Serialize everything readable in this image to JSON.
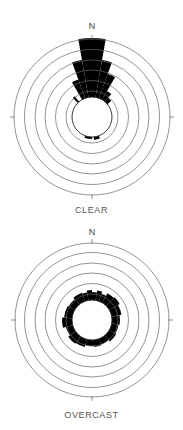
{
  "chart_data": [
    {
      "type": "rose",
      "title": "CLEAR",
      "north_label": "N",
      "center": [
        92,
        117
      ],
      "inner_radius": 20,
      "ring_radii": [
        26,
        36.5,
        47,
        57,
        67.5,
        78
      ],
      "sectors_deg": [
        {
          "from": -30,
          "to": -20,
          "r": 40
        },
        {
          "from": -20,
          "to": -10,
          "r": 58
        },
        {
          "from": -10,
          "to": 0,
          "r": 79
        },
        {
          "from": 0,
          "to": 10,
          "r": 79
        },
        {
          "from": 10,
          "to": 20,
          "r": 58
        },
        {
          "from": 20,
          "to": 30,
          "r": 46
        },
        {
          "from": 30,
          "to": 40,
          "r": 30
        },
        {
          "from": 40,
          "to": 50,
          "r": 25
        },
        {
          "from": -45,
          "to": -40,
          "r": 27
        },
        {
          "from": 160,
          "to": 175,
          "r": 23
        },
        {
          "from": 180,
          "to": 200,
          "r": 22
        }
      ]
    },
    {
      "type": "rose",
      "title": "OVERCAST",
      "north_label": "N",
      "center": [
        92,
        320
      ],
      "inner_radius": 20,
      "ring_radii": [
        26,
        36.5,
        47,
        57,
        67.5,
        77
      ],
      "sectors_deg": [
        {
          "from": -40,
          "to": -20,
          "r": 29
        },
        {
          "from": -20,
          "to": -10,
          "r": 28
        },
        {
          "from": -10,
          "to": 0,
          "r": 30
        },
        {
          "from": 0,
          "to": 10,
          "r": 28
        },
        {
          "from": 10,
          "to": 20,
          "r": 30
        },
        {
          "from": 20,
          "to": 30,
          "r": 28
        },
        {
          "from": 30,
          "to": 45,
          "r": 31
        },
        {
          "from": 45,
          "to": 60,
          "r": 32
        },
        {
          "from": 60,
          "to": 80,
          "r": 30
        },
        {
          "from": 80,
          "to": 100,
          "r": 28
        },
        {
          "from": 100,
          "to": 120,
          "r": 27
        },
        {
          "from": 120,
          "to": 140,
          "r": 28
        },
        {
          "from": 140,
          "to": 160,
          "r": 26
        },
        {
          "from": 160,
          "to": 175,
          "r": 27
        },
        {
          "from": 175,
          "to": 195,
          "r": 26
        },
        {
          "from": 195,
          "to": 215,
          "r": 28
        },
        {
          "from": 215,
          "to": 235,
          "r": 29
        },
        {
          "from": 235,
          "to": 255,
          "r": 27
        },
        {
          "from": 255,
          "to": 275,
          "r": 30
        },
        {
          "from": 275,
          "to": 300,
          "r": 28
        },
        {
          "from": 300,
          "to": 320,
          "r": 27
        }
      ]
    }
  ],
  "labels": {
    "top_title": "CLEAR",
    "bottom_title": "OVERCAST",
    "north": "N"
  },
  "colors": {
    "fill": "#000000",
    "ring": "#666666",
    "text": "#555555"
  }
}
